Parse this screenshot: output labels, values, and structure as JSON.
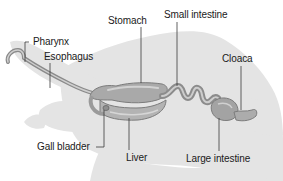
{
  "diagram": {
    "labels": {
      "pharynx": "Pharynx",
      "esophagus": "Esophagus",
      "stomach": "Stomach",
      "small_intestine": "Small intestine",
      "cloaca": "Cloaca",
      "gall_bladder": "Gall bladder",
      "liver": "Liver",
      "large_intestine": "Large intestine"
    },
    "colors": {
      "background": "#ffffff",
      "silhouette": "#e4e4e4",
      "organ_fill": "#a9a9a9",
      "organ_shadow": "#7c7c7c",
      "organ_highlight": "#d2d2d2",
      "leader_line": "#3a3a3a",
      "text": "#1a1a1a"
    }
  }
}
